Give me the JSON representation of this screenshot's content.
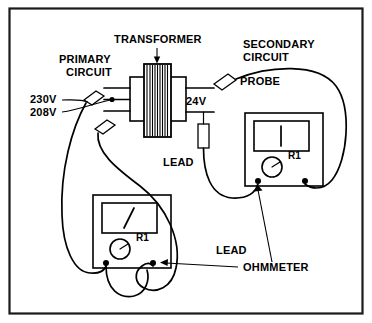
{
  "figure": {
    "type": "electrical-schematic",
    "title_visible": false,
    "background_color": "#ffffff",
    "line_color": "#000000",
    "border_color": "#1a1a1a"
  },
  "labels": {
    "transformer": "TRANSFORMER",
    "primary_circuit_line1": "PRIMARY",
    "primary_circuit_line2": "CIRCUIT",
    "secondary_circuit_line1": "SECONDARY",
    "secondary_circuit_line2": "CIRCUIT",
    "probe": "PROBE",
    "voltage_230": "230V",
    "voltage_208": "208V",
    "voltage_24": "24V",
    "lead_secondary": "LEAD",
    "lead_primary": "LEAD",
    "ohmmeter": "OHMMETER",
    "meter_range_upper": "R1",
    "meter_range_lower": "R1"
  },
  "components": {
    "transformer": {
      "name": "transformer",
      "core_hatch_lines": 17,
      "primary_terminals": 3,
      "secondary_terminals": 2
    },
    "ohmmeter_upper": {
      "name": "ohmmeter-secondary",
      "range_label": "R1",
      "needle_angle": "vertical",
      "terminals": 2
    },
    "ohmmeter_lower": {
      "name": "ohmmeter-primary",
      "range_label": "R1",
      "needle_angle": "slanted",
      "terminals": 2
    },
    "probes": [
      {
        "name": "probe-secondary",
        "location": "secondary-top"
      },
      {
        "name": "probe-primary-upper",
        "location": "primary-top"
      },
      {
        "name": "probe-primary-lower",
        "location": "primary-bottom"
      },
      {
        "name": "probe-secondary-lower",
        "location": "secondary-bottom"
      }
    ]
  }
}
